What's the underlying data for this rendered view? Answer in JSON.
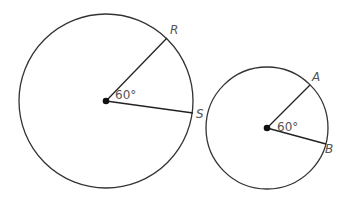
{
  "diagram": {
    "colors": {
      "stroke": "#333333",
      "label": "#555555"
    },
    "circles": [
      {
        "name": "large-circle",
        "center": [
          106,
          101
        ],
        "radius": 87,
        "angle_label": "60°",
        "points": [
          {
            "label": "R",
            "x": 167,
            "y": 38
          },
          {
            "label": "S",
            "x": 193,
            "y": 113
          }
        ]
      },
      {
        "name": "small-circle",
        "center": [
          267,
          128
        ],
        "radius": 61,
        "angle_label": "60°",
        "points": [
          {
            "label": "A",
            "x": 310,
            "y": 85
          },
          {
            "label": "B",
            "x": 326,
            "y": 144
          }
        ]
      }
    ]
  }
}
